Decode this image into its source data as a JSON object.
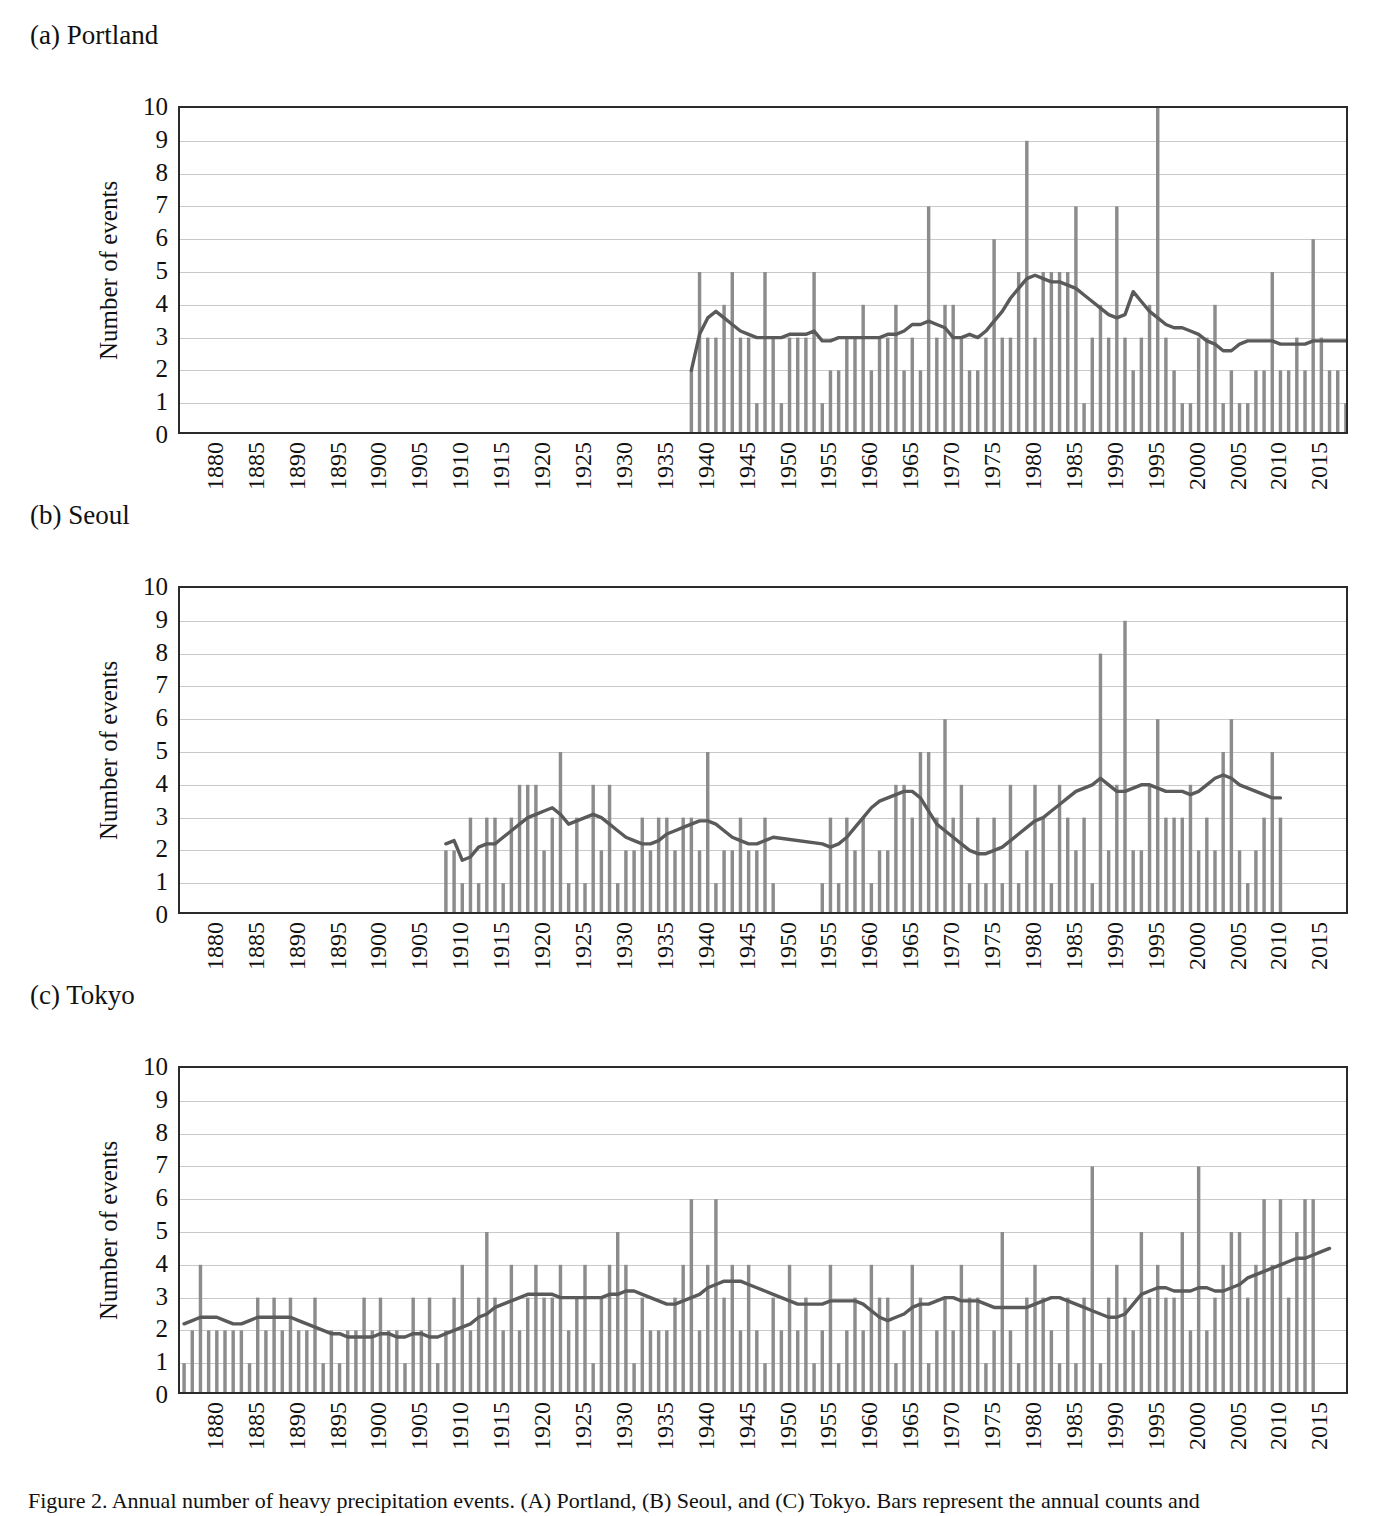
{
  "figure": {
    "caption": "Figure 2. Annual number of heavy precipitation events. (A) Portland, (B) Seoul, and (C) Tokyo. Bars represent the annual counts and"
  },
  "axis": {
    "ylabel": "Number of events",
    "yticks": [
      "10",
      "9",
      "8",
      "7",
      "6",
      "5",
      "4",
      "3",
      "2",
      "1",
      "0"
    ],
    "ylim": [
      0,
      10
    ],
    "xticks": [
      "1880",
      "1885",
      "1890",
      "1895",
      "1900",
      "1905",
      "1910",
      "1915",
      "1920",
      "1925",
      "1930",
      "1935",
      "1940",
      "1945",
      "1950",
      "1955",
      "1960",
      "1965",
      "1970",
      "1975",
      "1980",
      "1985",
      "1990",
      "1995",
      "2000",
      "2005",
      "2010",
      "2015"
    ],
    "xlim": [
      1876,
      2018
    ],
    "grid": true
  },
  "colors": {
    "bar": "#8c8c8c",
    "line": "#5a5a5a",
    "axis": "#2b2b2b",
    "grid": "#c9c9c9",
    "text": "#111111"
  },
  "panels": [
    {
      "key": "portland",
      "label": "(a) Portland"
    },
    {
      "key": "seoul",
      "label": "(b) Seoul"
    },
    {
      "key": "tokyo",
      "label": "(c) Tokyo"
    }
  ],
  "chart_data": [
    {
      "type": "bar",
      "title": "(a) Portland",
      "xlabel": "",
      "ylabel": "Number of events",
      "ylim": [
        0,
        10
      ],
      "xlim": [
        1876,
        2018
      ],
      "grid": true,
      "legend": "none",
      "series": [
        {
          "name": "Number of events",
          "kind": "bar",
          "color": "#8c8c8c"
        },
        {
          "name": "Moving average",
          "kind": "line",
          "color": "#5a5a5a"
        }
      ],
      "x": [
        1938,
        1939,
        1940,
        1941,
        1942,
        1943,
        1944,
        1945,
        1946,
        1947,
        1948,
        1949,
        1950,
        1951,
        1952,
        1953,
        1954,
        1955,
        1956,
        1957,
        1958,
        1959,
        1960,
        1961,
        1962,
        1963,
        1964,
        1965,
        1966,
        1967,
        1968,
        1969,
        1970,
        1971,
        1972,
        1973,
        1974,
        1975,
        1976,
        1977,
        1978,
        1979,
        1980,
        1981,
        1982,
        1983,
        1984,
        1985,
        1986,
        1987,
        1988,
        1989,
        1990,
        1991,
        1992,
        1993,
        1994,
        1995,
        1996,
        1997,
        1998,
        1999,
        2000,
        2001,
        2002,
        2003,
        2004,
        2005,
        2006,
        2007,
        2008,
        2009,
        2010,
        2011,
        2012,
        2013,
        2014,
        2015,
        2016,
        2017,
        2018
      ],
      "values": [
        2,
        5,
        3,
        3,
        4,
        5,
        3,
        3,
        1,
        5,
        3,
        1,
        3,
        3,
        3,
        5,
        1,
        2,
        2,
        3,
        3,
        4,
        2,
        3,
        3,
        4,
        2,
        3,
        2,
        7,
        3,
        4,
        4,
        3,
        2,
        2,
        3,
        6,
        3,
        3,
        5,
        9,
        3,
        5,
        5,
        5,
        5,
        7,
        1,
        3,
        4,
        3,
        7,
        3,
        2,
        3,
        4,
        10,
        3,
        2,
        1,
        1,
        3,
        3,
        4,
        1,
        2,
        1,
        1,
        2,
        2,
        5,
        2,
        2,
        3,
        2,
        6,
        3,
        2,
        2,
        1
      ],
      "trend": [
        2.0,
        3.1,
        3.6,
        3.8,
        3.6,
        3.4,
        3.2,
        3.1,
        3.0,
        3.0,
        3.0,
        3.0,
        3.1,
        3.1,
        3.1,
        3.2,
        2.9,
        2.9,
        3.0,
        3.0,
        3.0,
        3.0,
        3.0,
        3.0,
        3.1,
        3.1,
        3.2,
        3.4,
        3.4,
        3.5,
        3.4,
        3.3,
        3.0,
        3.0,
        3.1,
        3.0,
        3.2,
        3.5,
        3.8,
        4.2,
        4.5,
        4.8,
        4.9,
        4.8,
        4.7,
        4.7,
        4.6,
        4.5,
        4.3,
        4.1,
        3.9,
        3.7,
        3.6,
        3.7,
        4.4,
        4.1,
        3.8,
        3.6,
        3.4,
        3.3,
        3.3,
        3.2,
        3.1,
        2.9,
        2.8,
        2.6,
        2.6,
        2.8,
        2.9,
        2.9,
        2.9,
        2.9,
        2.8,
        2.8,
        2.8,
        2.8,
        2.9,
        2.9,
        2.9,
        2.9,
        2.9
      ]
    },
    {
      "type": "bar",
      "title": "(b) Seoul",
      "xlabel": "",
      "ylabel": "Number of events",
      "ylim": [
        0,
        10
      ],
      "xlim": [
        1876,
        2018
      ],
      "grid": true,
      "legend": "none",
      "series": [
        {
          "name": "Number of events",
          "kind": "bar",
          "color": "#8c8c8c"
        },
        {
          "name": "Moving average",
          "kind": "line",
          "color": "#5a5a5a"
        }
      ],
      "x": [
        1908,
        1909,
        1910,
        1911,
        1912,
        1913,
        1914,
        1915,
        1916,
        1917,
        1918,
        1919,
        1920,
        1921,
        1922,
        1923,
        1924,
        1925,
        1926,
        1927,
        1928,
        1929,
        1930,
        1931,
        1932,
        1933,
        1934,
        1935,
        1936,
        1937,
        1938,
        1939,
        1940,
        1941,
        1942,
        1943,
        1944,
        1945,
        1946,
        1947,
        1948,
        1954,
        1955,
        1956,
        1957,
        1958,
        1959,
        1960,
        1961,
        1962,
        1963,
        1964,
        1965,
        1966,
        1967,
        1968,
        1969,
        1970,
        1971,
        1972,
        1973,
        1974,
        1975,
        1976,
        1977,
        1978,
        1979,
        1980,
        1981,
        1982,
        1983,
        1984,
        1985,
        1986,
        1987,
        1988,
        1989,
        1990,
        1991,
        1992,
        1993,
        1994,
        1995,
        1996,
        1997,
        1998,
        1999,
        2000,
        2001,
        2002,
        2003,
        2004,
        2005,
        2006,
        2007,
        2008,
        2009,
        2010,
        2011,
        2012,
        2013,
        2014,
        2015,
        2016,
        2017,
        2018
      ],
      "values": [
        2,
        2,
        1,
        3,
        1,
        3,
        3,
        1,
        3,
        4,
        4,
        4,
        2,
        3,
        5,
        1,
        3,
        1,
        4,
        2,
        4,
        1,
        2,
        2,
        3,
        2,
        3,
        3,
        2,
        3,
        3,
        2,
        5,
        1,
        2,
        2,
        3,
        2,
        2,
        3,
        1,
        1,
        3,
        1,
        3,
        2,
        3,
        1,
        2,
        2,
        4,
        4,
        3,
        5,
        5,
        3,
        6,
        3,
        4,
        1,
        3,
        1,
        3,
        1,
        4,
        1,
        2,
        4,
        3,
        1,
        4,
        3,
        2,
        3,
        1,
        8,
        2,
        4,
        9,
        2,
        2,
        4,
        6,
        3,
        3,
        3,
        4,
        2,
        3,
        2,
        5,
        6,
        2,
        1,
        2,
        3,
        5,
        3
      ],
      "trend": [
        2.2,
        2.3,
        1.7,
        1.8,
        2.1,
        2.2,
        2.2,
        2.4,
        2.6,
        2.8,
        3.0,
        3.1,
        3.2,
        3.3,
        3.1,
        2.8,
        2.9,
        3.0,
        3.1,
        3.0,
        2.8,
        2.6,
        2.4,
        2.3,
        2.2,
        2.2,
        2.3,
        2.5,
        2.6,
        2.7,
        2.8,
        2.9,
        2.9,
        2.8,
        2.6,
        2.4,
        2.3,
        2.2,
        2.2,
        2.3,
        2.4,
        2.2,
        2.1,
        2.2,
        2.4,
        2.7,
        3.0,
        3.3,
        3.5,
        3.6,
        3.7,
        3.8,
        3.8,
        3.6,
        3.2,
        2.8,
        2.6,
        2.4,
        2.2,
        2.0,
        1.9,
        1.9,
        2.0,
        2.1,
        2.3,
        2.5,
        2.7,
        2.9,
        3.0,
        3.2,
        3.4,
        3.6,
        3.8,
        3.9,
        4.0,
        4.2,
        4.0,
        3.8,
        3.8,
        3.9,
        4.0,
        4.0,
        3.9,
        3.8,
        3.8,
        3.8,
        3.7,
        3.8,
        4.0,
        4.2,
        4.3,
        4.2,
        4.0,
        3.9,
        3.8,
        3.7,
        3.6,
        3.6
      ]
    },
    {
      "type": "bar",
      "title": "(c) Tokyo",
      "xlabel": "",
      "ylabel": "Number of events",
      "ylim": [
        0,
        10
      ],
      "xlim": [
        1876,
        2018
      ],
      "grid": true,
      "legend": "none",
      "series": [
        {
          "name": "Number of events",
          "kind": "bar",
          "color": "#8c8c8c"
        },
        {
          "name": "Moving average",
          "kind": "line",
          "color": "#5a5a5a"
        }
      ],
      "x": [
        1876,
        1877,
        1878,
        1879,
        1880,
        1881,
        1882,
        1883,
        1884,
        1885,
        1886,
        1887,
        1888,
        1889,
        1890,
        1891,
        1892,
        1893,
        1894,
        1895,
        1896,
        1897,
        1898,
        1899,
        1900,
        1901,
        1902,
        1903,
        1904,
        1905,
        1906,
        1907,
        1908,
        1909,
        1910,
        1911,
        1912,
        1913,
        1914,
        1915,
        1916,
        1917,
        1918,
        1919,
        1920,
        1921,
        1922,
        1923,
        1924,
        1925,
        1926,
        1927,
        1928,
        1929,
        1930,
        1931,
        1932,
        1933,
        1934,
        1935,
        1936,
        1937,
        1938,
        1939,
        1940,
        1941,
        1942,
        1943,
        1944,
        1945,
        1946,
        1947,
        1948,
        1949,
        1950,
        1951,
        1952,
        1953,
        1954,
        1955,
        1956,
        1957,
        1958,
        1959,
        1960,
        1961,
        1962,
        1963,
        1964,
        1965,
        1966,
        1967,
        1968,
        1969,
        1970,
        1971,
        1972,
        1973,
        1974,
        1975,
        1976,
        1977,
        1978,
        1979,
        1980,
        1981,
        1982,
        1983,
        1984,
        1985,
        1986,
        1987,
        1988,
        1989,
        1990,
        1991,
        1992,
        1993,
        1994,
        1995,
        1996,
        1997,
        1998,
        1999,
        2000,
        2001,
        2002,
        2003,
        2004,
        2005,
        2006,
        2007,
        2008,
        2009,
        2010,
        2011,
        2012,
        2013,
        2014,
        2015,
        2016,
        2017,
        2018
      ],
      "values": [
        1,
        2,
        4,
        2,
        2,
        2,
        2,
        2,
        1,
        3,
        2,
        3,
        2,
        3,
        2,
        2,
        3,
        1,
        2,
        1,
        2,
        2,
        3,
        2,
        3,
        2,
        2,
        1,
        3,
        2,
        3,
        1,
        2,
        3,
        4,
        2,
        3,
        5,
        3,
        2,
        4,
        2,
        3,
        4,
        3,
        3,
        4,
        2,
        3,
        4,
        1,
        3,
        4,
        5,
        4,
        1,
        3,
        2,
        2,
        2,
        3,
        4,
        6,
        2,
        4,
        6,
        3,
        4,
        2,
        4,
        2,
        1,
        3,
        2,
        4,
        2,
        3,
        1,
        2,
        4,
        1,
        2,
        3,
        2,
        4,
        3,
        3,
        1,
        2,
        4,
        3,
        1,
        2,
        3,
        2,
        4,
        3,
        3,
        1,
        2,
        5,
        2,
        1,
        3,
        4,
        3,
        2,
        1,
        3,
        1,
        3,
        7,
        1,
        3,
        4,
        3,
        2,
        5,
        3,
        4,
        3,
        3,
        5,
        2,
        7,
        2,
        3,
        4,
        5,
        5,
        3,
        4,
        6,
        4,
        6,
        3,
        5,
        6,
        6
      ],
      "trend": [
        2.2,
        2.3,
        2.4,
        2.4,
        2.4,
        2.3,
        2.2,
        2.2,
        2.3,
        2.4,
        2.4,
        2.4,
        2.4,
        2.4,
        2.3,
        2.2,
        2.1,
        2.0,
        1.9,
        1.9,
        1.8,
        1.8,
        1.8,
        1.8,
        1.9,
        1.9,
        1.8,
        1.8,
        1.9,
        1.9,
        1.8,
        1.8,
        1.9,
        2.0,
        2.1,
        2.2,
        2.4,
        2.5,
        2.7,
        2.8,
        2.9,
        3.0,
        3.1,
        3.1,
        3.1,
        3.1,
        3.0,
        3.0,
        3.0,
        3.0,
        3.0,
        3.0,
        3.1,
        3.1,
        3.2,
        3.2,
        3.1,
        3.0,
        2.9,
        2.8,
        2.8,
        2.9,
        3.0,
        3.1,
        3.3,
        3.4,
        3.5,
        3.5,
        3.5,
        3.4,
        3.3,
        3.2,
        3.1,
        3.0,
        2.9,
        2.8,
        2.8,
        2.8,
        2.8,
        2.9,
        2.9,
        2.9,
        2.9,
        2.8,
        2.6,
        2.4,
        2.3,
        2.4,
        2.5,
        2.7,
        2.8,
        2.8,
        2.9,
        3.0,
        3.0,
        2.9,
        2.9,
        2.9,
        2.8,
        2.7,
        2.7,
        2.7,
        2.7,
        2.7,
        2.8,
        2.9,
        3.0,
        3.0,
        2.9,
        2.8,
        2.7,
        2.6,
        2.5,
        2.4,
        2.4,
        2.5,
        2.8,
        3.1,
        3.2,
        3.3,
        3.3,
        3.2,
        3.2,
        3.2,
        3.3,
        3.3,
        3.2,
        3.2,
        3.3,
        3.4,
        3.6,
        3.7,
        3.8,
        3.9,
        4.0,
        4.1,
        4.2,
        4.2,
        4.3,
        4.4,
        4.5
      ]
    }
  ]
}
